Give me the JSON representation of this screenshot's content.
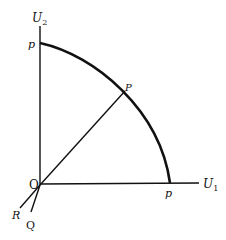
{
  "diagram": {
    "type": "utility-possibility-frontier",
    "axes": {
      "vertical": {
        "label": "U",
        "subscript": "2"
      },
      "horizontal": {
        "label": "U",
        "subscript": "1"
      }
    },
    "origin_label": "O",
    "frontier_labels": {
      "top": "p",
      "right": "p"
    },
    "point_label": "P",
    "rays": [
      {
        "label": "R"
      },
      {
        "label": "Q"
      }
    ]
  }
}
